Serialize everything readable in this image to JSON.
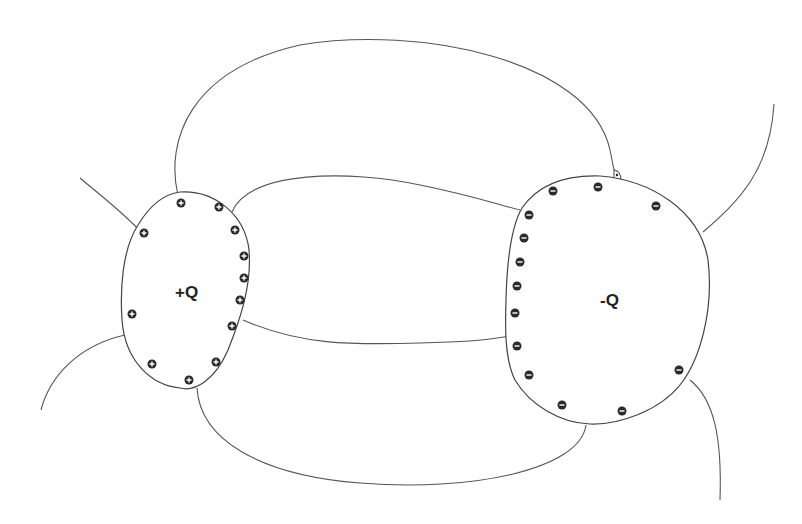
{
  "diagram": {
    "type": "electric field lines between two charged conductors",
    "conductors": [
      {
        "id": "positive",
        "label": "+Q",
        "charge_sign": "+",
        "charge_count": 13,
        "charges": [
          [
            180,
            203
          ],
          [
            218,
            207
          ],
          [
            236,
            230
          ],
          [
            244,
            248
          ],
          [
            243,
            278
          ],
          [
            241,
            300
          ],
          [
            237,
            320
          ],
          [
            230,
            326
          ],
          [
            144,
            234
          ],
          [
            131,
            314
          ],
          [
            152,
            362
          ],
          [
            187,
            380
          ],
          [
            216,
            360
          ]
        ]
      },
      {
        "id": "negative",
        "label": "-Q",
        "charge_sign": "-",
        "charge_count": 16,
        "charges": [
          [
            553,
            191
          ],
          [
            598,
            187
          ],
          [
            656,
            206
          ],
          [
            529,
            215
          ],
          [
            524,
            238
          ],
          [
            520,
            262
          ],
          [
            517,
            286
          ],
          [
            515,
            313
          ],
          [
            517,
            346
          ],
          [
            529,
            374
          ],
          [
            562,
            405
          ],
          [
            622,
            411
          ],
          [
            679,
            370
          ],
          [
            517,
            285
          ],
          [
            516,
            313
          ],
          [
            519,
            262
          ]
        ]
      }
    ],
    "annotations": [
      {
        "id": "right-angle-marker",
        "description": "small right-angle mark with dot where field line meets -Q surface"
      }
    ],
    "colors": {
      "stroke": "#555555",
      "charge_fill": "#2a2a2a",
      "background": "#ffffff"
    }
  }
}
